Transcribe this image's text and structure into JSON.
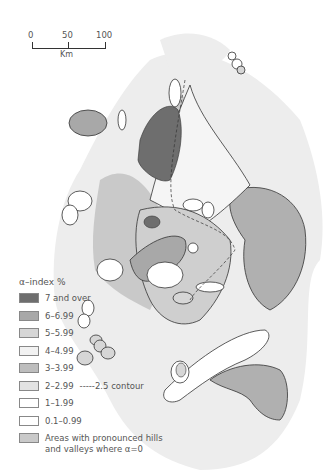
{
  "scale_bar": {
    "ticks": [
      "0",
      "50",
      "100"
    ],
    "unit": "Km"
  },
  "legend": {
    "title": "α–index %",
    "items": [
      {
        "label": "7 and over",
        "color": "#6e6e6e"
      },
      {
        "label": "6–6.99",
        "color": "#a8a8a8"
      },
      {
        "label": "5–5.99",
        "color": "#d6d6d6"
      },
      {
        "label": "4–4.99",
        "color": "#f2f2f2"
      },
      {
        "label": "3–3.99",
        "color": "#bdbdbd"
      },
      {
        "label": "2–2.99",
        "color": "#e3e3e3",
        "extra": "-----2.5 contour"
      },
      {
        "label": "1–1.99",
        "color": "#ffffff"
      },
      {
        "label": "0.1–0.99",
        "color": "#ffffff"
      },
      {
        "label": "Areas with pronounced hills and valleys where α=0",
        "color": "#c9c9c9"
      }
    ]
  },
  "colors": {
    "land": "#efefef",
    "outline": "#333333"
  }
}
